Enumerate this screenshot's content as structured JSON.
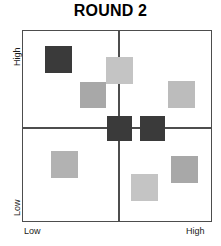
{
  "chart": {
    "title": "ROUND 2"
  },
  "axes": {
    "y_low_label": "Low",
    "y_high_label": "High",
    "x_low_label": "Low",
    "x_high_label": "High"
  },
  "chart_data": {
    "type": "scatter",
    "title": "ROUND 2",
    "xlabel": "",
    "ylabel": "",
    "xlim": [
      0,
      100
    ],
    "ylim": [
      0,
      100
    ],
    "x_tick_labels": [
      "Low",
      "High"
    ],
    "y_tick_labels": [
      "Low",
      "High"
    ],
    "grid": false,
    "legend": null,
    "quadrant_divider_x": 50,
    "quadrant_divider_y": 50,
    "marker": "square",
    "points": [
      {
        "id": "item-1",
        "x": 15.5,
        "y": 84.0,
        "size": 27,
        "color": "#3a3a3a",
        "shade": "dark",
        "quadrant": "top-left"
      },
      {
        "id": "item-2",
        "x": 45.5,
        "y": 78.0,
        "size": 27,
        "color": "#c4c4c4",
        "shade": "light",
        "quadrant": "top-left"
      },
      {
        "id": "item-3",
        "x": 32.0,
        "y": 65.0,
        "size": 26,
        "color": "#a8a8a8",
        "shade": "medium",
        "quadrant": "top-left"
      },
      {
        "id": "item-4",
        "x": 79.5,
        "y": 65.5,
        "size": 27,
        "color": "#bcbcbc",
        "shade": "light",
        "quadrant": "top-right"
      },
      {
        "id": "item-5",
        "x": 46.0,
        "y": 47.5,
        "size": 25,
        "color": "#3a3a3a",
        "shade": "dark",
        "quadrant": "center-left"
      },
      {
        "id": "item-6",
        "x": 63.5,
        "y": 47.5,
        "size": 25,
        "color": "#3a3a3a",
        "shade": "dark",
        "quadrant": "center-right"
      },
      {
        "id": "item-7",
        "x": 22.0,
        "y": 30.5,
        "size": 27,
        "color": "#b2b2b2",
        "shade": "medium",
        "quadrant": "bottom-left"
      },
      {
        "id": "item-8",
        "x": 81.5,
        "y": 27.5,
        "size": 27,
        "color": "#a8a8a8",
        "shade": "medium",
        "quadrant": "bottom-right"
      },
      {
        "id": "item-9",
        "x": 60.0,
        "y": 18.0,
        "size": 27,
        "color": "#c4c4c4",
        "shade": "light",
        "quadrant": "bottom-right"
      }
    ]
  },
  "squares": [
    {
      "name": "data-square-top-left-dark",
      "left": 22,
      "top": 15,
      "size": 27,
      "color": "#3a3a3a"
    },
    {
      "name": "data-square-top-center-light",
      "left": 83,
      "top": 26,
      "size": 27,
      "color": "#c4c4c4"
    },
    {
      "name": "data-square-upper-mid-grey",
      "left": 57,
      "top": 51,
      "size": 26,
      "color": "#a8a8a8"
    },
    {
      "name": "data-square-top-right-light",
      "left": 145,
      "top": 50,
      "size": 27,
      "color": "#bcbcbc"
    },
    {
      "name": "data-square-center-left-dark",
      "left": 84,
      "top": 85,
      "size": 25,
      "color": "#3a3a3a"
    },
    {
      "name": "data-square-center-right-dark",
      "left": 117,
      "top": 85,
      "size": 25,
      "color": "#3a3a3a"
    },
    {
      "name": "data-square-bottom-left-grey",
      "left": 28,
      "top": 120,
      "size": 27,
      "color": "#b2b2b2"
    },
    {
      "name": "data-square-bottom-right-grey",
      "left": 148,
      "top": 125,
      "size": 27,
      "color": "#a8a8a8"
    },
    {
      "name": "data-square-bottom-mid-light",
      "left": 108,
      "top": 143,
      "size": 27,
      "color": "#c4c4c4"
    }
  ],
  "dividers": {
    "vertical_left": 95,
    "horizontal_top": 96
  },
  "colors": {
    "frame": "#4d4d4d",
    "dark_square": "#3a3a3a",
    "medium_square": "#a8a8a8",
    "light_square": "#c4c4c4",
    "text": "#000000"
  }
}
